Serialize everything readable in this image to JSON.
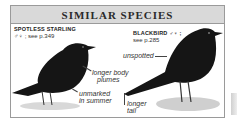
{
  "panel": {
    "title": "SIMILAR SPECIES",
    "colors": {
      "header_bg": "#d9d9d9",
      "border": "#9a9a9a",
      "bird": "#151515"
    }
  },
  "species": [
    {
      "name": "SPOTLESS STARLING",
      "sex_symbols": "♂♀",
      "reference": "see p.349",
      "ref_line": "♂♀ ; see p.349",
      "annotations": [
        {
          "text": "longer body plumes",
          "line1": "longer body",
          "line2": "plumes"
        },
        {
          "text": "unmarked in summer",
          "line1": "unmarked",
          "line2": "in summer"
        }
      ]
    },
    {
      "name": "BLACKBIRD",
      "sex_symbols": "♂♀",
      "reference": "see p.285",
      "name_line": "BLACKBIRD ♂♀ ;",
      "annotations": [
        {
          "text": "unspotted",
          "line1": "unspotted"
        },
        {
          "text": "longer tail",
          "line1": "longer",
          "line2": "tail"
        }
      ]
    }
  ]
}
